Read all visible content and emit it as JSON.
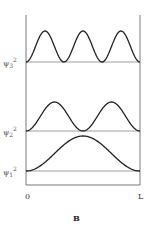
{
  "figure": {
    "panel_label": "B",
    "x_axis": {
      "start_label": "0",
      "end_label": "L"
    },
    "curves": [
      {
        "id": "psi3",
        "symbol": "ψ",
        "subscript": "3",
        "superscript": "2",
        "n": 3
      },
      {
        "id": "psi2",
        "symbol": "ψ",
        "subscript": "2",
        "superscript": "2",
        "n": 2
      },
      {
        "id": "psi1",
        "symbol": "ψ",
        "subscript": "1",
        "superscript": "2",
        "n": 1
      }
    ],
    "colors": {
      "curve": "#222222",
      "baseline": "#777777",
      "axis": "#555555"
    }
  },
  "chart_data": {
    "type": "line",
    "title": "",
    "xlabel": "",
    "ylabel": "",
    "x_ticks": [
      "0",
      "L"
    ],
    "series": [
      {
        "name": "ψ3²",
        "function": "sin²(3πx/L)",
        "peaks": 3
      },
      {
        "name": "ψ2²",
        "function": "sin²(2πx/L)",
        "peaks": 2
      },
      {
        "name": "ψ1²",
        "function": "sin²(πx/L)",
        "peaks": 1
      }
    ],
    "panel": "B"
  }
}
